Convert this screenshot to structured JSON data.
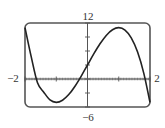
{
  "chart_data": {
    "type": "line",
    "title": "",
    "xlabel": "",
    "ylabel": "",
    "xlim": [
      -2,
      2
    ],
    "ylim": [
      -6,
      12
    ],
    "x_tick_labels": [
      "-2",
      "2"
    ],
    "y_tick_labels": [
      "12",
      "-6"
    ],
    "x_tick_step": 0.2,
    "y_tick_step": 3,
    "grid": false,
    "legend": null,
    "series": [
      {
        "name": "f(x)",
        "x": [
          -2.0,
          -1.8,
          -1.6,
          -1.4,
          -1.2,
          -1.0,
          -0.8,
          -0.6,
          -0.4,
          -0.2,
          0.0,
          0.2,
          0.4,
          0.6,
          0.8,
          1.0,
          1.2,
          1.4,
          1.6,
          1.8,
          2.0
        ],
        "y": [
          11.0,
          4.73,
          -0.82,
          -2.82,
          -4.49,
          -5.0,
          -4.55,
          -3.34,
          -1.54,
          0.63,
          3.0,
          5.37,
          7.54,
          9.34,
          10.55,
          11.0,
          10.49,
          8.82,
          5.82,
          1.27,
          -5.0
        ]
      }
    ],
    "annotations": {
      "extrema": [
        {
          "type": "min",
          "x": -1.0,
          "y": -5.0
        },
        {
          "type": "max",
          "x": 1.0,
          "y": 11.0
        }
      ]
    }
  },
  "labels": {
    "x_min": "−2",
    "x_max": "2",
    "y_max": "12",
    "y_min": "−6"
  },
  "colors": {
    "frame": "#555555",
    "curve": "#222222",
    "axis": "#555555",
    "text": "#333333"
  }
}
